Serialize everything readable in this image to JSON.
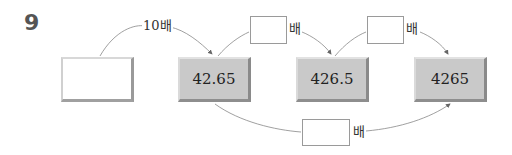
{
  "question": {
    "number": "9"
  },
  "boxes": [
    {
      "id": "start",
      "value": ""
    },
    {
      "id": "b1",
      "value": "42.65"
    },
    {
      "id": "b2",
      "value": "426.5"
    },
    {
      "id": "b3",
      "value": "4265"
    }
  ],
  "arrows": [
    {
      "from": "start",
      "to": "b1",
      "label": "10배"
    },
    {
      "from": "b1",
      "to": "b2",
      "answer": "",
      "suffix": "배"
    },
    {
      "from": "b2",
      "to": "b3",
      "answer": "",
      "suffix": "배"
    },
    {
      "from": "b1",
      "to": "b3",
      "answer": "",
      "suffix": "배"
    }
  ]
}
